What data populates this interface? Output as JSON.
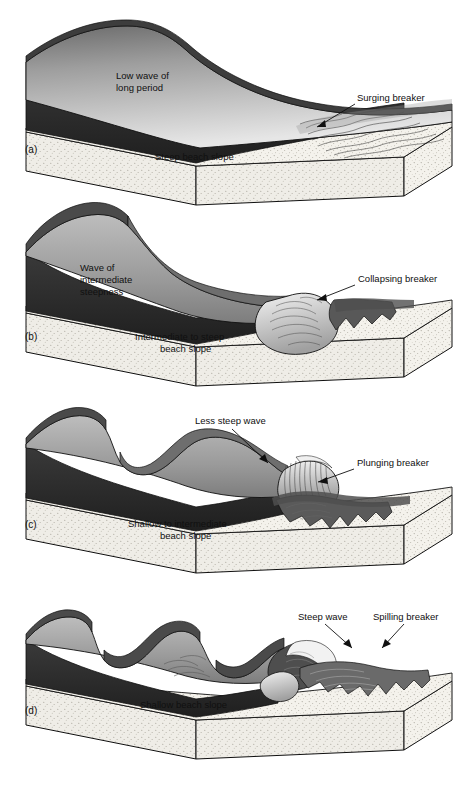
{
  "figure": {
    "background_color": "#ffffff",
    "line_color": "#101010",
    "sand_color": "#f2f0ea",
    "water_dark_color": "#2e2e2e",
    "water_light_color": "#cfcfcf",
    "foam_color": "#d9d9d9"
  },
  "panels": [
    {
      "key": "a",
      "panel_label": "(a)",
      "wave_label": "Low wave of\nlong period",
      "wave_label_line1": "Low wave of",
      "wave_label_line2": "long period",
      "breaker_label": "Surging breaker",
      "slope_label": "Steep beach slope",
      "slope_label_line1": "Steep beach slope",
      "slope_label_line2": "",
      "breaker_type": "surging",
      "beach_slope": "steep",
      "wave_steepness": "low wave of long period",
      "crest_count": 1
    },
    {
      "key": "b",
      "panel_label": "(b)",
      "wave_label": "Wave of\nintermediate\nsteepness",
      "wave_label_line1": "Wave of",
      "wave_label_line2": "intermediate",
      "wave_label_line3": "steepness",
      "breaker_label": "Collapsing breaker",
      "slope_label": "Intermediate to steep\nbeach slope",
      "slope_label_line1": "Intermediate to steep",
      "slope_label_line2": "beach slope",
      "breaker_type": "collapsing",
      "beach_slope": "intermediate to steep",
      "wave_steepness": "intermediate",
      "crest_count": 1
    },
    {
      "key": "c",
      "panel_label": "(c)",
      "wave_label": "Less steep wave",
      "wave_label_line1": "Less steep wave",
      "breaker_label": "Plunging breaker",
      "slope_label": "Shallow to intermediate\nbeach slope",
      "slope_label_line1": "Shallow to intermediate",
      "slope_label_line2": "beach slope",
      "breaker_type": "plunging",
      "beach_slope": "shallow to intermediate",
      "wave_steepness": "less steep",
      "crest_count": 2
    },
    {
      "key": "d",
      "panel_label": "(d)",
      "wave_label": "Steep wave",
      "wave_label_line1": "Steep wave",
      "breaker_label": "Spilling breaker",
      "slope_label": "Shallow beach slope",
      "slope_label_line1": "Shallow beach slope",
      "slope_label_line2": "",
      "breaker_type": "spilling",
      "beach_slope": "shallow",
      "wave_steepness": "steep",
      "crest_count": 3
    }
  ]
}
